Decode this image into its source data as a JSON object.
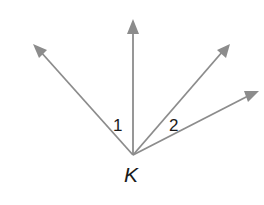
{
  "diagram": {
    "type": "angle-figure",
    "vertex": {
      "label": "K",
      "x": 133,
      "y": 155
    },
    "rays": [
      {
        "id": "ray-left",
        "tip": [
          33,
          44
        ]
      },
      {
        "id": "ray-vertical",
        "tip": [
          133,
          20
        ]
      },
      {
        "id": "ray-upper-right",
        "tip": [
          230,
          44
        ]
      },
      {
        "id": "ray-lower-right",
        "tip": [
          259,
          91
        ]
      }
    ],
    "angle_labels": [
      {
        "text": "1",
        "between": [
          "ray-left",
          "ray-vertical"
        ],
        "x": 113,
        "y": 131
      },
      {
        "text": "2",
        "between": [
          "ray-upper-right",
          "ray-lower-right"
        ],
        "x": 171,
        "y": 131
      }
    ],
    "colors": {
      "ray": "#8c8c8c",
      "text": "#1a1a1a",
      "background": "#ffffff"
    }
  }
}
